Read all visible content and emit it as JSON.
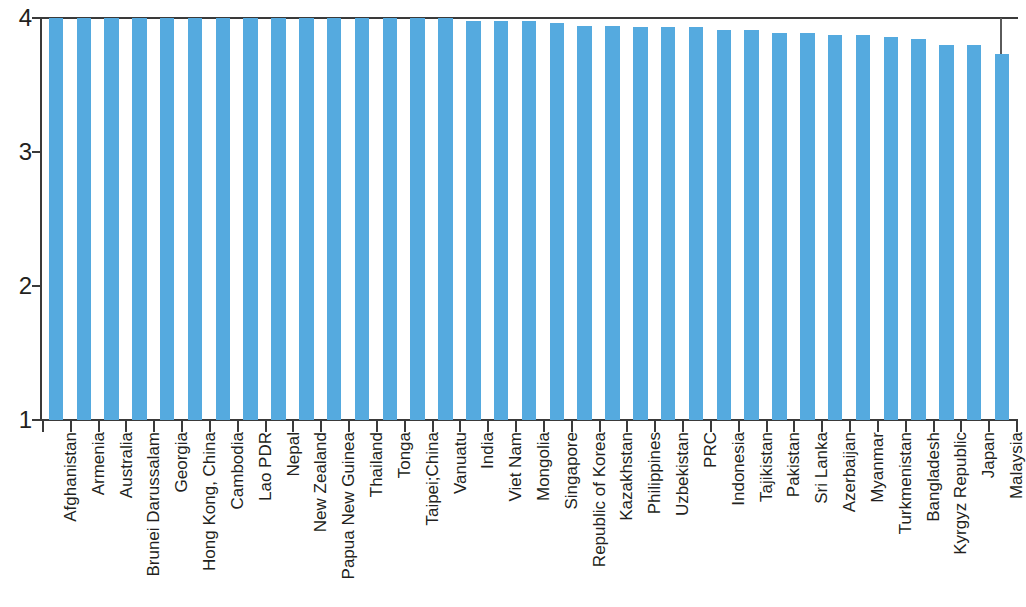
{
  "chart_data": {
    "type": "bar",
    "title": "",
    "subtitle": "",
    "xlabel": "",
    "ylabel": "",
    "ylim": [
      1,
      4
    ],
    "yticks": [
      1,
      2,
      3,
      4
    ],
    "ytick_labels": [
      "1",
      "2",
      "3",
      "4"
    ],
    "grid": false,
    "legend": null,
    "bar_color": "#55aadf",
    "axis_color": "#3a3a3a",
    "text_color": "#231f20",
    "orientation": "vertical",
    "sorted": "descending",
    "categories": [
      "Afghanistan",
      "Armenia",
      "Australia",
      "Brunei Darussalam",
      "Georgia",
      "Hong Kong, China",
      "Cambodia",
      "Lao PDR",
      "Nepal",
      "New Zealand",
      "Papua New Guinea",
      "Thailand",
      "Tonga",
      "Taipei;China",
      "Vanuatu",
      "India",
      "Viet Nam",
      "Mongolia",
      "Singapore",
      "Republic of Korea",
      "Kazakhstan",
      "Philippines",
      "Uzbekistan",
      "PRC",
      "Indonesia",
      "Tajikistan",
      "Pakistan",
      "Sri Lanka",
      "Azerbaijan",
      "Myanmar",
      "Turkmenistan",
      "Bangladesh",
      "Kyrgyz Republic",
      "Japan",
      "Malaysia"
    ],
    "values": [
      4.0,
      4.0,
      4.0,
      4.0,
      4.0,
      4.0,
      4.0,
      4.0,
      4.0,
      4.0,
      4.0,
      4.0,
      4.0,
      4.0,
      4.0,
      3.98,
      3.98,
      3.98,
      3.96,
      3.94,
      3.94,
      3.93,
      3.93,
      3.93,
      3.91,
      3.91,
      3.89,
      3.89,
      3.87,
      3.87,
      3.86,
      3.84,
      3.8,
      3.8,
      3.73
    ]
  }
}
